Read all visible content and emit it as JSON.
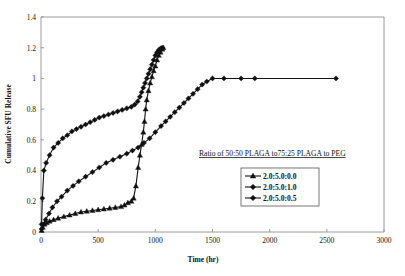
{
  "chart_data": {
    "type": "line",
    "title": "",
    "xlabel": "Time (hr)",
    "ylabel": "Cumulative SFU Release",
    "xlim": [
      0,
      3000
    ],
    "ylim": [
      0,
      1.4
    ],
    "xticks": [
      0,
      500,
      1000,
      1500,
      2000,
      2500,
      3000
    ],
    "yticks": [
      0,
      0.2,
      0.4,
      0.6,
      0.8,
      1,
      1.2,
      1.4
    ],
    "xticklabels": [
      "0",
      "500",
      "1000",
      "1500",
      "2000",
      "2500",
      "3000"
    ],
    "yticklabels": [
      "0",
      "0.2",
      "0.4",
      "0.6",
      "0.8",
      "1",
      "1.2",
      "1.4"
    ],
    "grid": false,
    "legend_position": "inside-right",
    "legend_title": "Ratio of 50:50 PLAGA to75:25 PLAGA to PEG",
    "series": [
      {
        "name": "2.0:5.0:0.0",
        "marker": "triangle",
        "color": "#111111",
        "points": [
          [
            5,
            0.01
          ],
          [
            15,
            0.03
          ],
          [
            30,
            0.05
          ],
          [
            50,
            0.06
          ],
          [
            75,
            0.07
          ],
          [
            110,
            0.08
          ],
          [
            150,
            0.09
          ],
          [
            200,
            0.1
          ],
          [
            250,
            0.11
          ],
          [
            300,
            0.12
          ],
          [
            350,
            0.13
          ],
          [
            400,
            0.135
          ],
          [
            450,
            0.14
          ],
          [
            500,
            0.145
          ],
          [
            550,
            0.15
          ],
          [
            600,
            0.155
          ],
          [
            650,
            0.16
          ],
          [
            700,
            0.165
          ],
          [
            730,
            0.175
          ],
          [
            760,
            0.19
          ],
          [
            790,
            0.2
          ],
          [
            810,
            0.22
          ],
          [
            830,
            0.3
          ],
          [
            850,
            0.42
          ],
          [
            865,
            0.5
          ],
          [
            880,
            0.57
          ],
          [
            895,
            0.65
          ],
          [
            905,
            0.72
          ],
          [
            915,
            0.8
          ],
          [
            925,
            0.86
          ],
          [
            940,
            0.92
          ],
          [
            955,
            0.97
          ],
          [
            970,
            1.01
          ],
          [
            985,
            1.05
          ],
          [
            1000,
            1.08
          ],
          [
            1015,
            1.12
          ],
          [
            1030,
            1.15
          ],
          [
            1045,
            1.17
          ],
          [
            1060,
            1.19
          ],
          [
            1070,
            1.2
          ]
        ]
      },
      {
        "name": "2.0:5.0:1.0",
        "marker": "diamond",
        "color": "#111111",
        "points": [
          [
            5,
            0.02
          ],
          [
            20,
            0.05
          ],
          [
            40,
            0.08
          ],
          [
            70,
            0.12
          ],
          [
            100,
            0.16
          ],
          [
            140,
            0.2
          ],
          [
            180,
            0.23
          ],
          [
            230,
            0.27
          ],
          [
            280,
            0.3
          ],
          [
            330,
            0.33
          ],
          [
            390,
            0.36
          ],
          [
            450,
            0.39
          ],
          [
            510,
            0.42
          ],
          [
            570,
            0.45
          ],
          [
            630,
            0.47
          ],
          [
            690,
            0.49
          ],
          [
            750,
            0.51
          ],
          [
            800,
            0.53
          ],
          [
            850,
            0.55
          ],
          [
            900,
            0.58
          ],
          [
            950,
            0.61
          ],
          [
            1000,
            0.65
          ],
          [
            1050,
            0.69
          ],
          [
            1090,
            0.72
          ],
          [
            1130,
            0.75
          ],
          [
            1170,
            0.78
          ],
          [
            1210,
            0.81
          ],
          [
            1250,
            0.84
          ],
          [
            1290,
            0.87
          ],
          [
            1330,
            0.9
          ],
          [
            1370,
            0.93
          ],
          [
            1410,
            0.96
          ],
          [
            1450,
            0.98
          ],
          [
            1500,
            1.0
          ],
          [
            1600,
            1.0
          ],
          [
            1750,
            1.0
          ],
          [
            1870,
            1.0
          ],
          [
            2580,
            1.0
          ]
        ]
      },
      {
        "name": "2.0:5.0:0.5",
        "marker": "diamond",
        "color": "#111111",
        "points": [
          [
            5,
            0.05
          ],
          [
            12,
            0.22
          ],
          [
            25,
            0.4
          ],
          [
            45,
            0.45
          ],
          [
            75,
            0.5
          ],
          [
            110,
            0.55
          ],
          [
            150,
            0.58
          ],
          [
            190,
            0.61
          ],
          [
            230,
            0.63
          ],
          [
            270,
            0.655
          ],
          [
            310,
            0.67
          ],
          [
            350,
            0.685
          ],
          [
            390,
            0.7
          ],
          [
            430,
            0.715
          ],
          [
            470,
            0.73
          ],
          [
            510,
            0.745
          ],
          [
            550,
            0.755
          ],
          [
            590,
            0.765
          ],
          [
            630,
            0.775
          ],
          [
            670,
            0.785
          ],
          [
            710,
            0.795
          ],
          [
            750,
            0.805
          ],
          [
            790,
            0.815
          ],
          [
            820,
            0.83
          ],
          [
            845,
            0.85
          ],
          [
            865,
            0.88
          ],
          [
            880,
            0.91
          ],
          [
            895,
            0.94
          ],
          [
            910,
            0.97
          ],
          [
            925,
            1.0
          ],
          [
            940,
            1.03
          ],
          [
            955,
            1.06
          ],
          [
            970,
            1.09
          ],
          [
            985,
            1.12
          ],
          [
            1000,
            1.15
          ],
          [
            1015,
            1.17
          ],
          [
            1030,
            1.185
          ],
          [
            1045,
            1.195
          ],
          [
            1060,
            1.2
          ]
        ]
      }
    ]
  }
}
